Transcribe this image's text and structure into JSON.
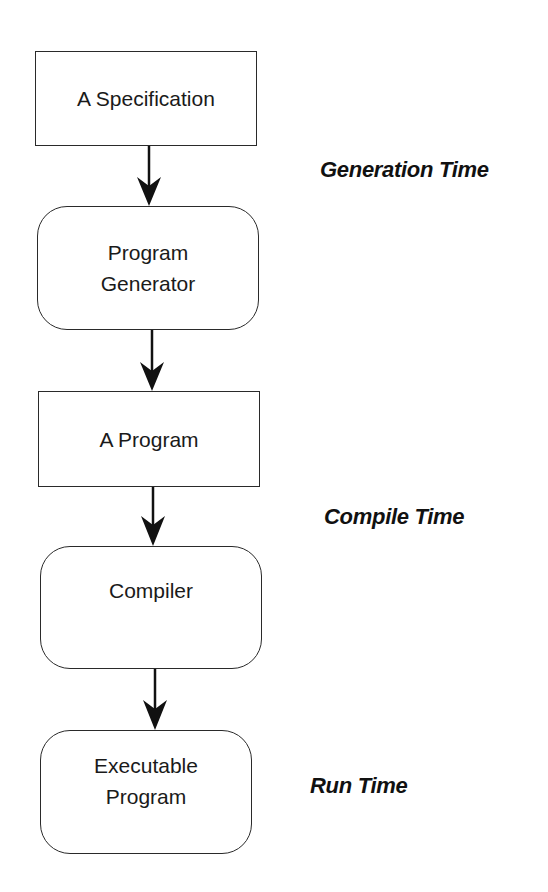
{
  "diagram": {
    "nodes": [
      {
        "id": "spec",
        "label": "A Specification",
        "shape": "rectangle"
      },
      {
        "id": "generator",
        "label": "Program\nGenerator",
        "shape": "rounded"
      },
      {
        "id": "program",
        "label": "A Program",
        "shape": "rectangle"
      },
      {
        "id": "compiler",
        "label": "Compiler",
        "shape": "rounded"
      },
      {
        "id": "executable",
        "label": "Executable\nProgram",
        "shape": "rounded"
      }
    ],
    "edges": [
      {
        "from": "spec",
        "to": "generator"
      },
      {
        "from": "generator",
        "to": "program"
      },
      {
        "from": "program",
        "to": "compiler"
      },
      {
        "from": "compiler",
        "to": "executable"
      }
    ],
    "phases": [
      {
        "label": "Generation Time"
      },
      {
        "label": "Compile Time"
      },
      {
        "label": "Run Time"
      }
    ],
    "colors": {
      "stroke": "#2a2a2a",
      "text": "#1a1a1a",
      "background": "#ffffff"
    }
  }
}
